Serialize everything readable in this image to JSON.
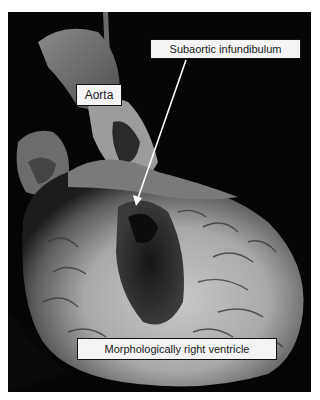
{
  "figure": {
    "type": "anatomical specimen photograph",
    "background_color": "#050505",
    "margin_color": "#ffffff"
  },
  "labels": {
    "aorta": "Aorta",
    "subaortic_infundibulum": "Subaortic infundibulum",
    "right_ventricle": "Morphologically right ventricle"
  },
  "annotations": [
    {
      "label": "Subaortic infundibulum",
      "arrow": {
        "from": [
          186,
          60
        ],
        "to": [
          136,
          205
        ],
        "color": "#ffffff"
      }
    }
  ]
}
